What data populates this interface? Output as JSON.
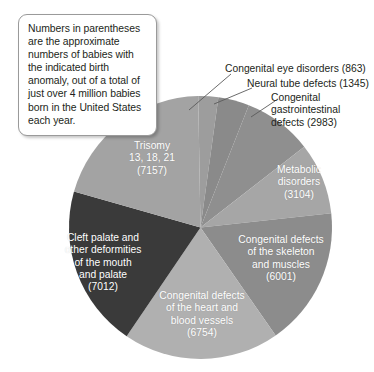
{
  "note": {
    "text": "Numbers in parentheses are the approximate numbers of babies with the indicated birth anomaly, out of a total of just over 4 million babies born in the United States each year."
  },
  "chart_data": {
    "type": "pie",
    "title": "",
    "legend_position": "none",
    "grid": false,
    "units": "babies per year",
    "total": 35219,
    "categories": [
      "Congenital eye disorders",
      "Neural tube defects",
      "Congenital gastrointestinal defects",
      "Metabolic disorders",
      "Congenital defects of the skeleton and muscles",
      "Congenital defects of the heart and blood vessels",
      "Cleft palate and other deformities of the mouth and palate",
      "Trisomy 13, 18, 21"
    ],
    "values": [
      863,
      1345,
      2983,
      3104,
      6001,
      6754,
      7012,
      7157
    ],
    "slices": [
      {
        "name": "congenital-eye-disorders",
        "label": "Congenital eye disorders (863)",
        "label_lines": "Congenital eye disorders (863)",
        "value": 863,
        "color": "#9d9d9d",
        "label_type": "external"
      },
      {
        "name": "neural-tube-defects",
        "label": "Neural tube defects (1345)",
        "label_lines": "Neural tube defects (1345)",
        "value": 1345,
        "color": "#8a8a8a",
        "label_type": "external"
      },
      {
        "name": "congenital-gastrointestinal-defects",
        "label": "Congenital gastrointestinal defects (2983)",
        "label_lines": "Congenital\ngastrointestinal\ndefects (2983)",
        "value": 2983,
        "color": "#8f8f8f",
        "label_type": "external"
      },
      {
        "name": "metabolic-disorders",
        "label": "Metabolic disorders (3104)",
        "label_lines": "Metabolic\ndisorders\n(3104)",
        "value": 3104,
        "color": "#a6a6a6",
        "label_type": "internal"
      },
      {
        "name": "congenital-defects-skeleton-muscles",
        "label": "Congenital defects of the skeleton and muscles (6001)",
        "label_lines": "Congenital defects\nof the skeleton\nand muscles\n(6001)",
        "value": 6001,
        "color": "#8c8c8c",
        "label_type": "internal"
      },
      {
        "name": "congenital-defects-heart-blood-vessels",
        "label": "Congenital defects of the heart and blood vessels (6754)",
        "label_lines": "Congenital defects\nof the heart and\nblood vessels\n(6754)",
        "value": 6754,
        "color": "#b0b0b0",
        "label_type": "internal"
      },
      {
        "name": "cleft-palate-mouth-palate",
        "label": "Cleft palate and other deformities of the mouth and palate (7012)",
        "label_lines": "Cleft palate and\nother deformities\nof the mouth\nand palate\n(7012)",
        "value": 7012,
        "color": "#3a3a3a",
        "label_type": "internal"
      },
      {
        "name": "trisomy-13-18-21",
        "label": "Trisomy 13, 18, 21 (7157)",
        "label_lines": "Trisomy\n13, 18, 21\n(7157)",
        "value": 7157,
        "color": "#a3a3a3",
        "label_type": "internal"
      }
    ]
  }
}
